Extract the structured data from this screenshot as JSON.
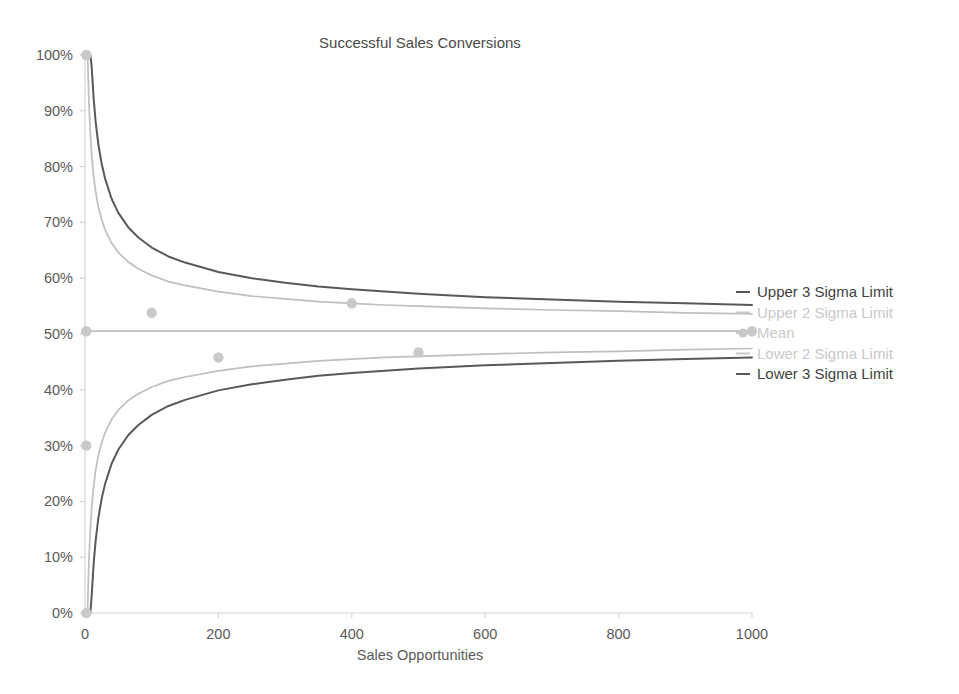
{
  "chart_data": {
    "type": "line",
    "title": "Successful Sales Conversions",
    "xlabel": "Sales Opportunities",
    "ylabel": "",
    "xlim": [
      0,
      1000
    ],
    "ylim": [
      0,
      1.0
    ],
    "grid": false,
    "legend_position": "right",
    "x_ticks": [
      "0",
      "200",
      "400",
      "600",
      "800",
      "1000"
    ],
    "x_tick_values": [
      0,
      200,
      400,
      600,
      800,
      1000
    ],
    "y_ticks": [
      "0%",
      "10%",
      "20%",
      "30%",
      "40%",
      "50%",
      "60%",
      "70%",
      "80%",
      "90%",
      "100%"
    ],
    "y_tick_values": [
      0,
      10,
      20,
      30,
      40,
      50,
      60,
      70,
      80,
      90,
      100
    ],
    "mean_value": 0.505,
    "series": [
      {
        "name": "Upper 3 Sigma Limit",
        "color": "#595959",
        "type": "line",
        "x": [
          1,
          2,
          3,
          4,
          5,
          6,
          8,
          10,
          13,
          16,
          20,
          25,
          30,
          40,
          50,
          65,
          80,
          100,
          125,
          150,
          200,
          250,
          300,
          350,
          400,
          450,
          500,
          600,
          700,
          800,
          900,
          1000
        ],
        "values": [
          1.0,
          1.0,
          1.0,
          1.0,
          1.0,
          1.117,
          1.035,
          0.979,
          0.921,
          0.88,
          0.84,
          0.805,
          0.779,
          0.742,
          0.717,
          0.691,
          0.673,
          0.655,
          0.639,
          0.628,
          0.611,
          0.6,
          0.592,
          0.585,
          0.58,
          0.576,
          0.572,
          0.566,
          0.562,
          0.558,
          0.555,
          0.552
        ]
      },
      {
        "name": "Upper 2 Sigma Limit",
        "color": "#bfbfbf",
        "type": "line",
        "x": [
          1,
          2,
          3,
          4,
          5,
          6,
          8,
          10,
          13,
          16,
          20,
          25,
          30,
          40,
          50,
          65,
          80,
          100,
          125,
          150,
          200,
          250,
          300,
          350,
          400,
          450,
          500,
          600,
          700,
          800,
          900,
          1000
        ],
        "values": [
          1.0,
          1.0,
          1.0,
          1.0,
          0.952,
          0.913,
          0.859,
          0.821,
          0.782,
          0.754,
          0.728,
          0.705,
          0.687,
          0.663,
          0.646,
          0.629,
          0.617,
          0.605,
          0.594,
          0.587,
          0.576,
          0.568,
          0.563,
          0.558,
          0.555,
          0.552,
          0.55,
          0.546,
          0.543,
          0.541,
          0.538,
          0.536
        ]
      },
      {
        "name": "Mean",
        "color": "#bfbfbf",
        "type": "line",
        "x": [
          0,
          1000
        ],
        "values": [
          0.505,
          0.505
        ]
      },
      {
        "name": "Lower 2 Sigma Limit",
        "color": "#bfbfbf",
        "type": "line",
        "x": [
          1,
          2,
          3,
          4,
          5,
          6,
          8,
          10,
          13,
          16,
          20,
          25,
          30,
          40,
          50,
          65,
          80,
          100,
          125,
          150,
          200,
          250,
          300,
          350,
          400,
          450,
          500,
          600,
          700,
          800,
          900,
          1000
        ],
        "values": [
          0.0,
          0.0,
          0.0,
          0.01,
          0.058,
          0.097,
          0.151,
          0.189,
          0.228,
          0.256,
          0.282,
          0.305,
          0.323,
          0.347,
          0.364,
          0.381,
          0.393,
          0.405,
          0.416,
          0.423,
          0.434,
          0.442,
          0.447,
          0.452,
          0.455,
          0.458,
          0.46,
          0.464,
          0.467,
          0.469,
          0.472,
          0.474
        ]
      },
      {
        "name": "Lower 3 Sigma Limit",
        "color": "#595959",
        "type": "line",
        "x": [
          1,
          2,
          3,
          4,
          5,
          6,
          8,
          10,
          13,
          16,
          20,
          25,
          30,
          40,
          50,
          65,
          80,
          100,
          125,
          150,
          200,
          250,
          300,
          350,
          400,
          450,
          500,
          600,
          700,
          800,
          900,
          1000
        ],
        "values": [
          0.0,
          0.0,
          0.0,
          0.0,
          0.0,
          0.0,
          0.0,
          0.031,
          0.089,
          0.13,
          0.17,
          0.205,
          0.231,
          0.268,
          0.293,
          0.319,
          0.337,
          0.355,
          0.371,
          0.382,
          0.399,
          0.41,
          0.418,
          0.425,
          0.43,
          0.434,
          0.438,
          0.444,
          0.448,
          0.452,
          0.455,
          0.458
        ]
      },
      {
        "name": "Observations",
        "color": "#c9c9c9",
        "type": "scatter",
        "points": [
          {
            "x": 2,
            "y": 1.0
          },
          {
            "x": 2,
            "y": 0.505
          },
          {
            "x": 2,
            "y": 0.3
          },
          {
            "x": 2,
            "y": 0.0
          },
          {
            "x": 100,
            "y": 0.538
          },
          {
            "x": 200,
            "y": 0.458
          },
          {
            "x": 400,
            "y": 0.555
          },
          {
            "x": 500,
            "y": 0.467
          },
          {
            "x": 1000,
            "y": 0.505
          }
        ]
      }
    ],
    "legend": [
      {
        "label": "Upper 3 Sigma Limit",
        "color": "#3f3f3f",
        "marker": "dash",
        "marker_color": "#595959"
      },
      {
        "label": "Upper 2 Sigma Limit",
        "color": "#c9c9c9",
        "marker": "dash",
        "marker_color": "#c9c9c9"
      },
      {
        "label": "Mean",
        "color": "#c9c9c9",
        "marker": "dot-line",
        "marker_color": "#c9c9c9"
      },
      {
        "label": "Lower 2 Sigma Limit",
        "color": "#c9c9c9",
        "marker": "dash",
        "marker_color": "#c9c9c9"
      },
      {
        "label": "Lower 3 Sigma Limit",
        "color": "#3f3f3f",
        "marker": "dash",
        "marker_color": "#595959"
      }
    ]
  }
}
